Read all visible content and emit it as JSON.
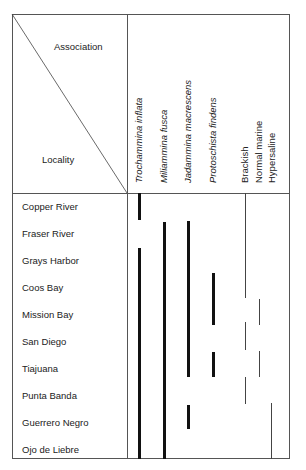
{
  "header": {
    "association_label": "Association",
    "locality_label": "Locality"
  },
  "columns": [
    {
      "label": "Trochammina inflata",
      "italic": true
    },
    {
      "label": "Miliammina fusca",
      "italic": true
    },
    {
      "label": "Jadammina macrescens",
      "italic": true
    },
    {
      "label": "Protoschista findens",
      "italic": true
    },
    {
      "label": "Brackish",
      "italic": false
    },
    {
      "label": "Normal marine",
      "italic": false
    },
    {
      "label": "Hypersaline",
      "italic": false
    }
  ],
  "localities": [
    "Copper River",
    "Fraser River",
    "Grays Harbor",
    "Coos Bay",
    "Mission Bay",
    "San Diego",
    "Tiajuana",
    "Punta Banda",
    "Guerrero Negro",
    "Ojo de Liebre"
  ],
  "ranges": {
    "Trochammina inflata": [
      [
        "Copper River",
        "Copper River"
      ],
      [
        "Grays Harbor",
        "Ojo de Liebre"
      ]
    ],
    "Miliammina fusca": [
      [
        "Fraser River",
        "Ojo de Liebre"
      ]
    ],
    "Jadammina macrescens": [
      [
        "Fraser River",
        "Tiajuana"
      ],
      [
        "Guerrero Negro",
        "Guerrero Negro"
      ]
    ],
    "Protoschista findens": [
      [
        "Coos Bay",
        "Mission Bay"
      ],
      [
        "Tiajuana",
        "Tiajuana"
      ]
    ],
    "Brackish": [
      [
        "Copper River",
        "Mission Bay"
      ],
      [
        "San Diego",
        "San Diego"
      ],
      [
        "Punta Banda",
        "Punta Banda"
      ]
    ],
    "Normal marine": [
      [
        "Mission Bay",
        "Mission Bay"
      ],
      [
        "Tiajuana",
        "Tiajuana"
      ]
    ],
    "Hypersaline": [
      [
        "Guerrero Negro",
        "Ojo de Liebre"
      ]
    ]
  }
}
